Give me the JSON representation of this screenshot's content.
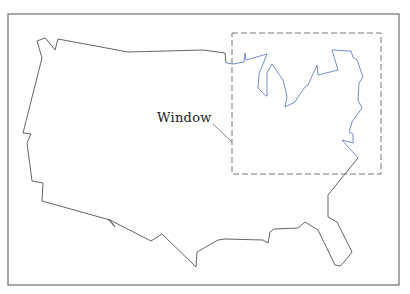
{
  "figure": {
    "frame": {
      "x": 8,
      "y": 14,
      "width": 391,
      "height": 271,
      "color": "#6e6e6e"
    },
    "outline_color": "#555555",
    "lakes_color": "#6a7fc4",
    "window_box": {
      "x": 232,
      "y": 33,
      "width": 149,
      "height": 141,
      "color": "#777777",
      "dash": "6,3"
    },
    "label": {
      "text": "Window"
    },
    "leader_line": {
      "x1": 213,
      "y1": 124,
      "x2": 232,
      "y2": 142
    }
  }
}
